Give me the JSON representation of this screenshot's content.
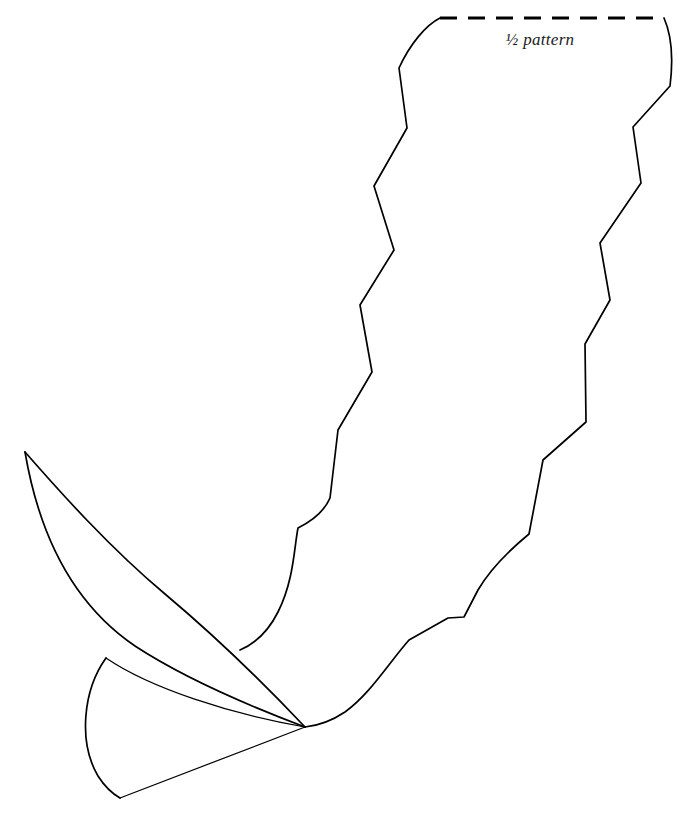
{
  "document": {
    "kind": "sewing-pattern-template",
    "title": "Half pattern leaf template",
    "background_color": "#ffffff",
    "ink_color": "#000000"
  },
  "annotations": {
    "fold_label": "½ pattern",
    "fold_label_x": 540,
    "fold_label_y": 45
  },
  "fold_line": {
    "name": "fold-line",
    "style": "dashed",
    "x1": 440,
    "y1": 18,
    "x2": 664,
    "y2": 18,
    "dash_pattern": "17 11",
    "stroke_width": 3.2
  },
  "shapes": {
    "body_left_edge": {
      "name": "sawtooth-left-edge",
      "description": "Zigzag / sawtooth left side of the half pattern running from the fold line down to the leaf junction",
      "d": "M 440 18 C 426 25 410 44 399 68 L 407 128 L 374 186 L 394 250 L 360 305 L 372 372 L 338 430 L 330 498 C 324 512 310 522 298 528 C 294 548 294 580 278 612 C 268 632 254 644 240 650"
    },
    "body_right_edge": {
      "name": "sawtooth-right-edge",
      "description": "Zigzag / sawtooth right side of the half pattern running from the fold line down to the converging tip",
      "d": "M 664 18 C 672 36 673 62 670 86 L 633 127 L 641 183 L 600 243 L 610 300 L 585 344 L 586 422 L 543 460 L 529 534 C 512 548 492 566 478 590 L 464 617 L 448 618 L 409 640 C 388 664 370 694 345 712 C 330 722 315 726 305 727"
    },
    "leaf_outer": {
      "name": "leaf-outer-curve",
      "description": "Long outer arc of the upper leaf, from its pointed tip sweeping right down to the convergence point",
      "d": "M 25 452 C 60 492 110 548 165 594 C 215 636 270 690 305 727"
    },
    "leaf_inner": {
      "name": "leaf-inner-curve",
      "description": "Inner concave arc of the upper leaf returning from the convergence point to the tip",
      "d": "M 305 727 C 260 710 190 682 135 646 C 85 612 42 552 25 452"
    },
    "petal_outer": {
      "name": "petal-outer-curve",
      "description": "Outer arc of the lower petal, from the junction on the leaf edge sweeping down-left to the lower point",
      "d": "M 106 658 C 83 690 78 742 98 776 C 105 787 113 794 120 798"
    },
    "petal_straight": {
      "name": "petal-straight-edge",
      "description": "Straight edge of the lower petal from the lower point to the convergence point",
      "d": "M 120 798 L 305 727"
    },
    "petal_inner": {
      "name": "petal-inner-curve",
      "description": "Thin sweeping line across the lower petal from the junction to the convergence point",
      "d": "M 106 658 C 150 688 230 714 305 727"
    }
  },
  "key_points": {
    "leaf_tip": {
      "x": 25,
      "y": 452
    },
    "convergence": {
      "x": 304,
      "y": 727
    },
    "petal_bottom": {
      "x": 120,
      "y": 798
    },
    "petal_junction": {
      "x": 106,
      "y": 658
    },
    "fold_left": {
      "x": 440,
      "y": 18
    },
    "fold_right": {
      "x": 664,
      "y": 18
    }
  }
}
